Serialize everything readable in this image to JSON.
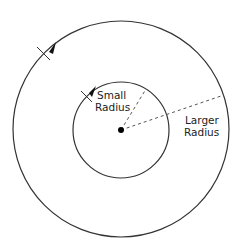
{
  "diagram": {
    "outer_circle": {
      "cx": 121,
      "cy": 129,
      "r": 108,
      "stroke": "#333333"
    },
    "inner_circle": {
      "cx": 121,
      "cy": 130,
      "r": 48,
      "stroke": "#333333"
    },
    "center_point": {
      "cx": 121,
      "cy": 130,
      "r": 3,
      "fill": "#000000"
    },
    "labels": {
      "small_radius_line1": "Small",
      "small_radius_line2": "Radius",
      "larger_radius_line1": "Larger",
      "larger_radius_line2": "Radius"
    },
    "direction": "counter-clockwise"
  }
}
